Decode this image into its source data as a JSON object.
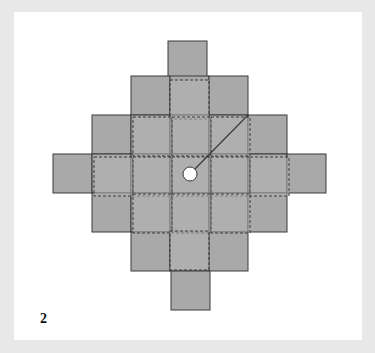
{
  "figure": {
    "label": "2",
    "colors": {
      "background": "#e8e8e8",
      "card": "#ffffff",
      "solid_square_fill": "#a9a9a9",
      "dashed_square_fill": "#b4b4b4",
      "stroke": "#3a3a3a",
      "circle_fill": "#ffffff"
    },
    "cell_size": 39,
    "solid_squares": [
      {
        "x": 168,
        "y": 41
      },
      {
        "x": 131,
        "y": 76
      },
      {
        "x": 170,
        "y": 76
      },
      {
        "x": 209,
        "y": 76
      },
      {
        "x": 92,
        "y": 115
      },
      {
        "x": 131,
        "y": 115
      },
      {
        "x": 170,
        "y": 115
      },
      {
        "x": 209,
        "y": 115
      },
      {
        "x": 248,
        "y": 115
      },
      {
        "x": 53,
        "y": 154
      },
      {
        "x": 92,
        "y": 154
      },
      {
        "x": 131,
        "y": 154
      },
      {
        "x": 170,
        "y": 154
      },
      {
        "x": 209,
        "y": 154
      },
      {
        "x": 248,
        "y": 154
      },
      {
        "x": 287,
        "y": 154
      },
      {
        "x": 92,
        "y": 193
      },
      {
        "x": 131,
        "y": 193
      },
      {
        "x": 170,
        "y": 193
      },
      {
        "x": 209,
        "y": 193
      },
      {
        "x": 248,
        "y": 193
      },
      {
        "x": 131,
        "y": 232
      },
      {
        "x": 170,
        "y": 232
      },
      {
        "x": 209,
        "y": 232
      },
      {
        "x": 171,
        "y": 271
      }
    ],
    "dashed_squares": [
      {
        "x": 170,
        "y": 80
      },
      {
        "x": 133,
        "y": 117
      },
      {
        "x": 172,
        "y": 117
      },
      {
        "x": 211,
        "y": 117
      },
      {
        "x": 94,
        "y": 157
      },
      {
        "x": 133,
        "y": 157
      },
      {
        "x": 172,
        "y": 157
      },
      {
        "x": 211,
        "y": 157
      },
      {
        "x": 250,
        "y": 157
      },
      {
        "x": 133,
        "y": 194
      },
      {
        "x": 172,
        "y": 194
      },
      {
        "x": 211,
        "y": 194
      },
      {
        "x": 170,
        "y": 231
      }
    ],
    "circle": {
      "cx": 190,
      "cy": 174,
      "r": 7
    },
    "radius_line": {
      "x1": 190,
      "y1": 174,
      "x2": 248,
      "y2": 115
    }
  }
}
